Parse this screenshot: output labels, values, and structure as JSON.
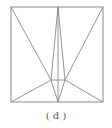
{
  "figure": {
    "caption": "( d )",
    "stroke_color": "#888888",
    "square": {
      "x1": 11,
      "y1": 7,
      "x2": 103,
      "y2": 102
    },
    "points": {
      "TL": [
        11,
        7
      ],
      "TR": [
        103,
        7
      ],
      "BL": [
        11,
        102
      ],
      "BR": [
        103,
        102
      ],
      "TM": [
        58,
        7
      ],
      "BM": [
        58,
        102
      ],
      "PL": [
        51,
        80
      ],
      "PR": [
        65,
        80
      ]
    },
    "segments": [
      [
        "TL",
        "PL"
      ],
      [
        "TR",
        "PR"
      ],
      [
        "TM",
        "PL"
      ],
      [
        "TM",
        "PR"
      ],
      [
        "TM",
        "BM"
      ],
      [
        "PL",
        "PR"
      ],
      [
        "PL",
        "BL"
      ],
      [
        "PR",
        "BR"
      ],
      [
        "PL",
        "BM"
      ],
      [
        "PR",
        "BM"
      ]
    ]
  }
}
